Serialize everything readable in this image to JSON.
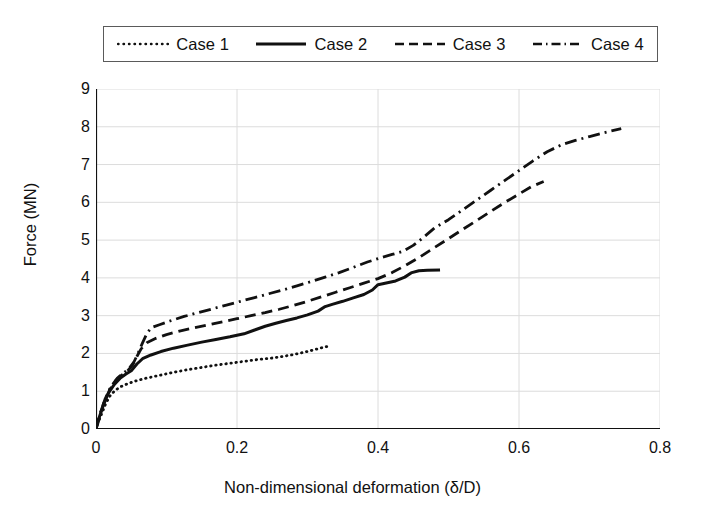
{
  "chart_data": {
    "type": "line",
    "title": "",
    "xlabel": "Non-dimensional deformation (δ/D)",
    "ylabel": "Force (MN)",
    "xlim": [
      0,
      0.8
    ],
    "ylim": [
      0,
      9
    ],
    "xticks": [
      "0",
      "0.2",
      "0.4",
      "0.6",
      "0.8"
    ],
    "xtick_values": [
      0,
      0.2,
      0.4,
      0.6,
      0.8
    ],
    "yticks": [
      "0",
      "1",
      "2",
      "3",
      "4",
      "5",
      "6",
      "7",
      "8",
      "9"
    ],
    "ytick_values": [
      0,
      1,
      2,
      3,
      4,
      5,
      6,
      7,
      8,
      9
    ],
    "grid": true,
    "legend_position": "top",
    "series": [
      {
        "name": "Case 1",
        "style": "dotted",
        "color": "#111111",
        "points": [
          [
            0.0,
            0.0
          ],
          [
            0.004,
            0.22
          ],
          [
            0.009,
            0.45
          ],
          [
            0.014,
            0.68
          ],
          [
            0.02,
            0.88
          ],
          [
            0.027,
            1.02
          ],
          [
            0.035,
            1.12
          ],
          [
            0.045,
            1.2
          ],
          [
            0.056,
            1.27
          ],
          [
            0.07,
            1.34
          ],
          [
            0.09,
            1.42
          ],
          [
            0.11,
            1.5
          ],
          [
            0.13,
            1.57
          ],
          [
            0.15,
            1.63
          ],
          [
            0.17,
            1.69
          ],
          [
            0.19,
            1.74
          ],
          [
            0.21,
            1.79
          ],
          [
            0.23,
            1.84
          ],
          [
            0.25,
            1.88
          ],
          [
            0.265,
            1.92
          ],
          [
            0.28,
            1.97
          ],
          [
            0.295,
            2.03
          ],
          [
            0.31,
            2.1
          ],
          [
            0.322,
            2.16
          ],
          [
            0.332,
            2.2
          ]
        ]
      },
      {
        "name": "Case 2",
        "style": "solid",
        "color": "#111111",
        "points": [
          [
            0.0,
            0.0
          ],
          [
            0.005,
            0.33
          ],
          [
            0.011,
            0.66
          ],
          [
            0.018,
            0.96
          ],
          [
            0.026,
            1.18
          ],
          [
            0.034,
            1.34
          ],
          [
            0.042,
            1.45
          ],
          [
            0.05,
            1.54
          ],
          [
            0.058,
            1.72
          ],
          [
            0.066,
            1.86
          ],
          [
            0.078,
            1.96
          ],
          [
            0.092,
            2.05
          ],
          [
            0.11,
            2.14
          ],
          [
            0.13,
            2.22
          ],
          [
            0.15,
            2.3
          ],
          [
            0.17,
            2.37
          ],
          [
            0.19,
            2.44
          ],
          [
            0.21,
            2.52
          ],
          [
            0.225,
            2.62
          ],
          [
            0.24,
            2.72
          ],
          [
            0.255,
            2.8
          ],
          [
            0.27,
            2.87
          ],
          [
            0.285,
            2.94
          ],
          [
            0.3,
            3.02
          ],
          [
            0.315,
            3.12
          ],
          [
            0.325,
            3.24
          ],
          [
            0.335,
            3.3
          ],
          [
            0.35,
            3.38
          ],
          [
            0.365,
            3.47
          ],
          [
            0.38,
            3.56
          ],
          [
            0.392,
            3.68
          ],
          [
            0.4,
            3.82
          ],
          [
            0.41,
            3.86
          ],
          [
            0.425,
            3.92
          ],
          [
            0.438,
            4.02
          ],
          [
            0.448,
            4.14
          ],
          [
            0.458,
            4.19
          ],
          [
            0.47,
            4.2
          ],
          [
            0.488,
            4.21
          ]
        ]
      },
      {
        "name": "Case 3",
        "style": "dashed",
        "color": "#111111",
        "points": [
          [
            0.0,
            0.0
          ],
          [
            0.005,
            0.36
          ],
          [
            0.012,
            0.74
          ],
          [
            0.02,
            1.06
          ],
          [
            0.028,
            1.28
          ],
          [
            0.036,
            1.42
          ],
          [
            0.044,
            1.52
          ],
          [
            0.052,
            1.7
          ],
          [
            0.058,
            1.92
          ],
          [
            0.064,
            2.12
          ],
          [
            0.072,
            2.28
          ],
          [
            0.085,
            2.4
          ],
          [
            0.1,
            2.5
          ],
          [
            0.12,
            2.6
          ],
          [
            0.14,
            2.68
          ],
          [
            0.16,
            2.76
          ],
          [
            0.18,
            2.84
          ],
          [
            0.2,
            2.92
          ],
          [
            0.22,
            3.0
          ],
          [
            0.24,
            3.08
          ],
          [
            0.26,
            3.17
          ],
          [
            0.28,
            3.27
          ],
          [
            0.3,
            3.38
          ],
          [
            0.32,
            3.5
          ],
          [
            0.34,
            3.62
          ],
          [
            0.36,
            3.74
          ],
          [
            0.38,
            3.86
          ],
          [
            0.4,
            3.98
          ],
          [
            0.42,
            4.14
          ],
          [
            0.44,
            4.34
          ],
          [
            0.46,
            4.56
          ],
          [
            0.48,
            4.8
          ],
          [
            0.5,
            5.04
          ],
          [
            0.52,
            5.28
          ],
          [
            0.54,
            5.52
          ],
          [
            0.56,
            5.76
          ],
          [
            0.58,
            6.0
          ],
          [
            0.6,
            6.22
          ],
          [
            0.618,
            6.42
          ],
          [
            0.635,
            6.55
          ]
        ]
      },
      {
        "name": "Case 4",
        "style": "dashdot",
        "color": "#111111",
        "points": [
          [
            0.0,
            0.0
          ],
          [
            0.006,
            0.4
          ],
          [
            0.013,
            0.8
          ],
          [
            0.021,
            1.12
          ],
          [
            0.03,
            1.34
          ],
          [
            0.038,
            1.47
          ],
          [
            0.046,
            1.58
          ],
          [
            0.054,
            1.78
          ],
          [
            0.06,
            2.02
          ],
          [
            0.066,
            2.28
          ],
          [
            0.072,
            2.52
          ],
          [
            0.078,
            2.68
          ],
          [
            0.09,
            2.76
          ],
          [
            0.105,
            2.86
          ],
          [
            0.125,
            2.98
          ],
          [
            0.145,
            3.08
          ],
          [
            0.165,
            3.18
          ],
          [
            0.185,
            3.28
          ],
          [
            0.205,
            3.38
          ],
          [
            0.225,
            3.48
          ],
          [
            0.245,
            3.58
          ],
          [
            0.265,
            3.68
          ],
          [
            0.285,
            3.79
          ],
          [
            0.305,
            3.9
          ],
          [
            0.325,
            4.02
          ],
          [
            0.345,
            4.14
          ],
          [
            0.365,
            4.28
          ],
          [
            0.385,
            4.42
          ],
          [
            0.405,
            4.54
          ],
          [
            0.42,
            4.62
          ],
          [
            0.435,
            4.7
          ],
          [
            0.45,
            4.86
          ],
          [
            0.465,
            5.08
          ],
          [
            0.48,
            5.32
          ],
          [
            0.5,
            5.54
          ],
          [
            0.52,
            5.8
          ],
          [
            0.54,
            6.06
          ],
          [
            0.56,
            6.32
          ],
          [
            0.58,
            6.58
          ],
          [
            0.6,
            6.84
          ],
          [
            0.62,
            7.1
          ],
          [
            0.64,
            7.34
          ],
          [
            0.66,
            7.52
          ],
          [
            0.68,
            7.64
          ],
          [
            0.7,
            7.74
          ],
          [
            0.72,
            7.84
          ],
          [
            0.745,
            7.95
          ]
        ]
      }
    ]
  }
}
